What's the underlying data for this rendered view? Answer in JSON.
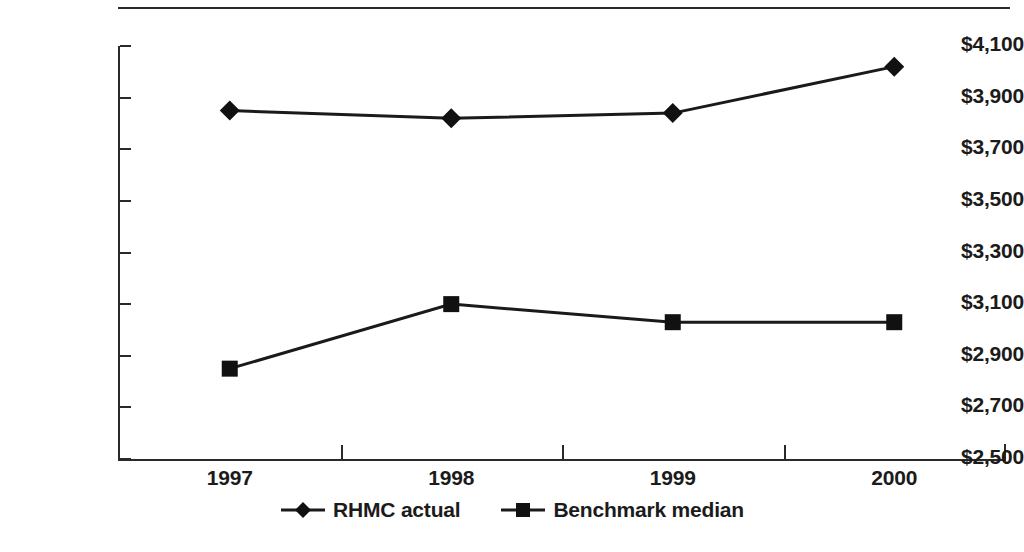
{
  "chart_data": {
    "type": "line",
    "title": "",
    "subtitle": "",
    "xlabel": "",
    "ylabel": "",
    "categories": [
      "1997",
      "1998",
      "1999",
      "2000"
    ],
    "series": [
      {
        "name": "RHMC actual",
        "marker": "diamond",
        "values": [
          3850,
          3820,
          3840,
          4020
        ]
      },
      {
        "name": "Benchmark median",
        "marker": "square",
        "values": [
          2850,
          3100,
          3030,
          3030
        ]
      }
    ],
    "ylim": [
      2500,
      4100
    ],
    "ytick_values": [
      2500,
      2700,
      2900,
      3100,
      3300,
      3500,
      3700,
      3900,
      4100
    ],
    "ytick_labels": [
      "$2,500",
      "$2,700",
      "$2,900",
      "$3,100",
      "$3,300",
      "$3,500",
      "$3,700",
      "$3,900",
      "$4,100"
    ],
    "grid": false,
    "legend_position": "bottom",
    "colors": {
      "line": "#1a1a1a",
      "marker": "#111111",
      "axis": "#2a2a2a",
      "background": "#ffffff"
    }
  },
  "legend": {
    "items": [
      {
        "label": "RHMC actual",
        "marker": "diamond"
      },
      {
        "label": "Benchmark median",
        "marker": "square"
      }
    ]
  }
}
